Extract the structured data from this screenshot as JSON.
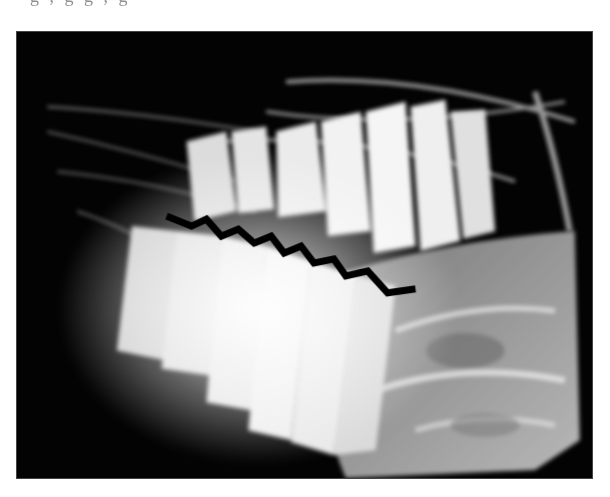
{
  "page": {
    "background": "#ffffff"
  },
  "figure": {
    "type": "radiograph",
    "colors": {
      "background": "#030303",
      "bone": "#bdbdbd",
      "teeth": "#e8e8e8",
      "highlight": "#ffffff"
    }
  },
  "text_fragments": {
    "top": "g   ,                g  g     ,   g",
    "bottom": "                                     "
  }
}
